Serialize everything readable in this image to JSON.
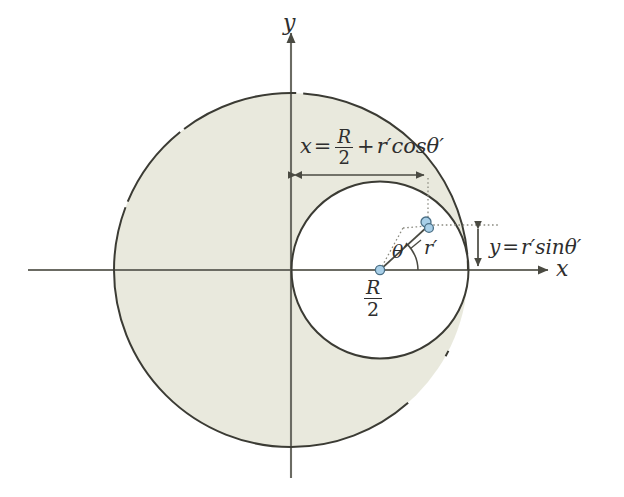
{
  "figure": {
    "background": "#ffffff",
    "width": 624,
    "height": 497
  },
  "colors": {
    "fill_large_circle": "#e9e9dd",
    "stroke_curve": "#3b3b34",
    "axis": "#6b6b63",
    "marker_fill": "#a8cfe8",
    "marker_stroke": "#4a6f86",
    "text": "#2e2e2e",
    "guide_dotted": "#8a8a80"
  },
  "axes": {
    "x_label": "x",
    "y_label": "y",
    "origin": {
      "x": 291,
      "y": 270
    }
  },
  "labels": {
    "equation_x": {
      "lhs": "x",
      "equals": "=",
      "fraction_num": "R",
      "fraction_den": "2",
      "plus": "+",
      "term": "r′cosθ′",
      "full": "x = R/2 + r′cosθ′"
    },
    "equation_y": {
      "lhs": "y",
      "equals": "=",
      "term": "r′sinθ′",
      "full": "y = r′sinθ′"
    },
    "center_offset": {
      "fraction_num": "R",
      "fraction_den": "2",
      "full": "R/2"
    },
    "angle": "θ′",
    "radius": "r′"
  },
  "shapes": {
    "large_circle": {
      "name": "large-circle",
      "center": {
        "x": 291,
        "y": 270
      },
      "radius": 177,
      "filled": true
    },
    "inner_circle": {
      "name": "inner-circle",
      "center": {
        "x": 380,
        "y": 270
      },
      "radius": 88,
      "filled": false
    },
    "point_marker": {
      "x": 428,
      "y": 225
    },
    "center_marker": {
      "x": 380,
      "y": 270
    }
  },
  "dimensions": {
    "horizontal": {
      "from_x": 291,
      "to_x": 428,
      "y": 175
    },
    "vertical": {
      "x": 478,
      "from_y": 225,
      "to_y": 270
    }
  },
  "icons": {
    "arrow_head": "arrow-head",
    "point_dot": "point-dot"
  }
}
